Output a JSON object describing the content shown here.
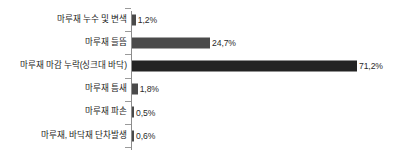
{
  "chart_data": {
    "type": "bar",
    "orientation": "horizontal",
    "title": "",
    "subtitle": "",
    "xlabel": "",
    "ylabel": "",
    "grid": false,
    "legend": false,
    "legend_position": "none",
    "xlim": [
      0,
      80
    ],
    "unit": "%",
    "axis_line_color": "#8c8c8c",
    "bar_color": "#4a4a4a",
    "bar_color_emphasis": "#232323",
    "categories": [
      "마루재 누수 및 변색",
      "마루재 들뜸",
      "마루재 마감 누락(싱크대 바닥)",
      "마루재 틈새",
      "마루재 파손",
      "마루재, 바닥재 단차발생"
    ],
    "values": [
      1.2,
      24.7,
      71.2,
      1.8,
      0.5,
      0.6
    ],
    "value_labels": [
      "1,2%",
      "24,7%",
      "71,2%",
      "1,8%",
      "0,5%",
      "0,6%"
    ],
    "bars": [
      {
        "label": "마루재 누수 및 변색",
        "value": 1.2,
        "value_label": "1,2%",
        "emphasis": false
      },
      {
        "label": "마루재 들뜸",
        "value": 24.7,
        "value_label": "24,7%",
        "emphasis": false
      },
      {
        "label": "마루재 마감 누락(싱크대 바닥)",
        "value": 71.2,
        "value_label": "71,2%",
        "emphasis": true
      },
      {
        "label": "마루재 틈새",
        "value": 1.8,
        "value_label": "1,8%",
        "emphasis": false
      },
      {
        "label": "마루재 파손",
        "value": 0.5,
        "value_label": "0,5%",
        "emphasis": false
      },
      {
        "label": "마루재, 바닥재 단차발생",
        "value": 0.6,
        "value_label": "0,6%",
        "emphasis": false
      }
    ]
  }
}
